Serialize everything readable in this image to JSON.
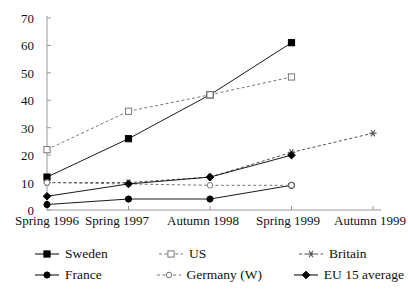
{
  "chart_data": {
    "type": "line",
    "title": "",
    "xlabel": "",
    "ylabel": "",
    "categories": [
      "Spring 1996",
      "Spring 1997",
      "Autumn 1998",
      "Spring 1999",
      "Autumn 1999"
    ],
    "ylim": [
      0,
      70
    ],
    "yticks": [
      0,
      10,
      20,
      30,
      40,
      50,
      60,
      70
    ],
    "grid": false,
    "legend_position": "bottom",
    "series": [
      {
        "name": "Sweden",
        "marker": "filled-square",
        "line": "solid",
        "color": "#000000",
        "values": [
          12,
          26,
          42,
          61,
          null
        ]
      },
      {
        "name": "US",
        "marker": "open-square",
        "line": "dashed",
        "color": "#777777",
        "values": [
          22,
          36,
          42,
          48.5,
          null
        ]
      },
      {
        "name": "Britain",
        "marker": "asterisk",
        "line": "dashed",
        "color": "#555555",
        "values": [
          10,
          10,
          12,
          21,
          28
        ]
      },
      {
        "name": "France",
        "marker": "filled-circle",
        "line": "solid",
        "color": "#000000",
        "values": [
          2,
          4,
          4,
          9,
          null
        ]
      },
      {
        "name": "Germany (W)",
        "marker": "open-circle",
        "line": "dashed",
        "color": "#777777",
        "values": [
          10,
          9.5,
          9,
          9,
          null
        ]
      },
      {
        "name": "EU 15 average",
        "marker": "filled-diamond",
        "line": "solid",
        "color": "#000000",
        "values": [
          5,
          9.5,
          12,
          20,
          null
        ]
      }
    ]
  },
  "axis": {
    "y_tick_labels": [
      "0",
      "10",
      "20",
      "30",
      "40",
      "50",
      "60",
      "70"
    ],
    "x_tick_labels": [
      "Spring 1996",
      "Spring 1997",
      "Autumn 1998",
      "Spring 1999",
      "Autumn 1999"
    ]
  },
  "legend": {
    "items": [
      {
        "label": "Sweden"
      },
      {
        "label": "US"
      },
      {
        "label": "Britain"
      },
      {
        "label": "France"
      },
      {
        "label": "Germany (W)"
      },
      {
        "label": "EU 15 average"
      }
    ]
  }
}
